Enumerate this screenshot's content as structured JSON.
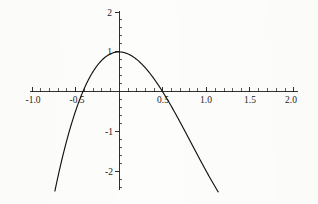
{
  "chart_data": {
    "type": "line",
    "title": "",
    "subtitle": "",
    "xlabel": "",
    "ylabel": "",
    "xlim": [
      -1.0,
      2.0
    ],
    "ylim": [
      -2.4,
      2.0
    ],
    "grid": false,
    "legend": null,
    "legend_position": "none",
    "axis_style": "crossing-axes-at-origin",
    "function_expression": "2 x^3 - 5 x^2 + 1",
    "x_ticks_major": [
      -1.0,
      -0.5,
      0.5,
      1.0,
      1.5,
      2.0
    ],
    "x_tick_labels": [
      "-1.0",
      "-0.5",
      "0.5",
      "1.0",
      "1.5",
      "2.0"
    ],
    "x_ticks_minor": [
      -0.9,
      -0.8,
      -0.7,
      -0.6,
      -0.4,
      -0.3,
      -0.2,
      -0.1,
      0.1,
      0.2,
      0.3,
      0.4,
      0.6,
      0.7,
      0.8,
      0.9,
      1.1,
      1.2,
      1.3,
      1.4,
      1.6,
      1.7,
      1.8,
      1.9
    ],
    "y_ticks_major": [
      -2,
      -1,
      1,
      2
    ],
    "y_tick_labels": [
      "-2",
      "-1",
      "1",
      "2"
    ],
    "y_ticks_minor": [
      -2.2,
      -1.8,
      -1.6,
      -1.4,
      -1.2,
      -0.8,
      -0.6,
      -0.4,
      -0.2,
      0.2,
      0.4,
      0.6,
      0.8,
      1.2,
      1.4,
      1.6,
      1.8
    ],
    "curve_color": "#111111",
    "axis_color": "#1a1a1a",
    "background_color": "#fdfdfc",
    "series": [
      {
        "name": "2x^3 - 5x^2 + 1",
        "x": [
          -1.0,
          -0.95,
          -0.9,
          -0.85,
          -0.8,
          -0.75,
          -0.7,
          -0.65,
          -0.6,
          -0.55,
          -0.5,
          -0.45,
          -0.4,
          -0.35,
          -0.3,
          -0.25,
          -0.2,
          -0.15,
          -0.1,
          -0.05,
          0.0,
          0.05,
          0.1,
          0.15,
          0.2,
          0.25,
          0.3,
          0.35,
          0.4,
          0.45,
          0.5,
          0.55,
          0.6,
          0.65,
          0.7,
          0.75,
          0.8,
          0.85,
          0.9,
          0.95,
          1.0,
          1.05,
          1.1,
          1.15,
          1.2,
          1.25,
          1.3,
          1.35,
          1.4,
          1.45,
          1.5,
          1.55,
          1.6,
          1.65,
          1.7,
          1.75,
          1.8,
          1.85,
          1.9,
          1.95,
          2.0
        ],
        "y": [
          -6.0,
          -5.23,
          -4.51,
          -3.84,
          -3.22,
          -2.66,
          -2.14,
          -1.66,
          -1.23,
          -0.85,
          -0.5,
          -0.19,
          0.08,
          0.31,
          0.51,
          0.67,
          0.79,
          0.88,
          0.95,
          0.99,
          1.0,
          0.99,
          0.95,
          0.89,
          0.82,
          0.73,
          0.64,
          0.53,
          0.42,
          0.3,
          0.19,
          0.07,
          -0.37,
          -0.29,
          -0.76,
          -0.83,
          -0.89,
          -0.94,
          -0.97,
          -0.99,
          -1.0,
          -0.99,
          -0.96,
          -0.92,
          -0.86,
          -0.78,
          -0.68,
          -0.56,
          -0.41,
          -0.24,
          -0.05,
          0.18,
          0.43,
          0.71,
          1.02,
          1.37,
          1.76,
          2.18,
          2.64,
          3.15,
          3.69
        ],
        "visible_domain": [
          -1.0,
          2.0
        ],
        "visible_range": [
          -2.35,
          2.0
        ],
        "local_maximum": {
          "x": 0.0,
          "y": 1.0
        },
        "local_minimum": {
          "x": 1.25,
          "y": -0.37
        },
        "roots": [
          -0.65,
          0.77,
          1.6
        ]
      }
    ],
    "annotations": []
  }
}
